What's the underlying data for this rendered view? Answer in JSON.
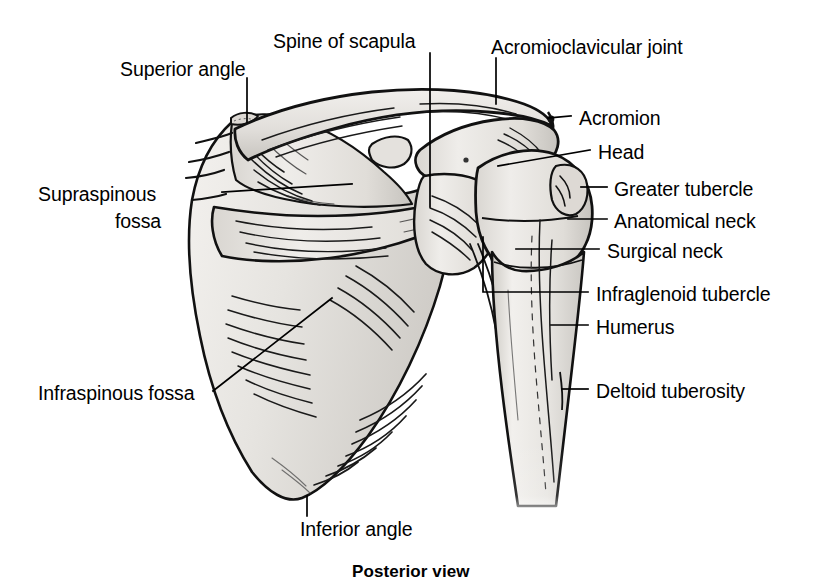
{
  "figure": {
    "caption": "Posterior view",
    "background_color": "#ffffff",
    "ink_color": "#000000",
    "bone_fill_color": "#e8e6e2",
    "bone_shadow_color": "#c9c6c1"
  },
  "labels": [
    {
      "id": "superior-angle",
      "text": "Superior angle",
      "x": 120,
      "y": 58,
      "align": "left"
    },
    {
      "id": "spine-of-scapula",
      "text": "Spine of scapula",
      "x": 273,
      "y": 30,
      "align": "left"
    },
    {
      "id": "acromioclavicular-joint",
      "text": "Acromioclavicular joint",
      "x": 491,
      "y": 36,
      "align": "left"
    },
    {
      "id": "acromion",
      "text": "Acromion",
      "x": 579,
      "y": 107,
      "align": "left"
    },
    {
      "id": "head",
      "text": "Head",
      "x": 598,
      "y": 141,
      "align": "left"
    },
    {
      "id": "greater-tubercle",
      "text": "Greater tubercle",
      "x": 614,
      "y": 178,
      "align": "left"
    },
    {
      "id": "anatomical-neck",
      "text": "Anatomical neck",
      "x": 614,
      "y": 210,
      "align": "left"
    },
    {
      "id": "surgical-neck",
      "text": "Surgical neck",
      "x": 607,
      "y": 240,
      "align": "left"
    },
    {
      "id": "infraglenoid-tubercle",
      "text": "Infraglenoid tubercle",
      "x": 596,
      "y": 283,
      "align": "left"
    },
    {
      "id": "humerus",
      "text": "Humerus",
      "x": 596,
      "y": 316,
      "align": "left"
    },
    {
      "id": "deltoid-tuberosity",
      "text": "Deltoid tuberosity",
      "x": 596,
      "y": 380,
      "align": "left"
    },
    {
      "id": "supraspinous-fossa-l1",
      "text": "Supraspinous",
      "x": 38,
      "y": 183,
      "align": "left"
    },
    {
      "id": "supraspinous-fossa-l2",
      "text": "fossa",
      "x": 115,
      "y": 210,
      "align": "left"
    },
    {
      "id": "infraspinous-fossa",
      "text": "Infraspinous fossa",
      "x": 38,
      "y": 382,
      "align": "left"
    },
    {
      "id": "inferior-angle",
      "text": "Inferior angle",
      "x": 300,
      "y": 518,
      "align": "left"
    }
  ],
  "caption_position": {
    "x": 352,
    "y": 562
  },
  "leader_lines": [
    {
      "id": "superior-angle-leader",
      "points": "247,78 247,122"
    },
    {
      "id": "spine-of-scapula-leader",
      "points": "430,53 430,207"
    },
    {
      "id": "acromioclavicular-joint-leader",
      "points": "496,58 496,102"
    },
    {
      "id": "acromion-leader",
      "points": "571,116 550,118"
    },
    {
      "id": "head-leader",
      "points": "590,150 498,166"
    },
    {
      "id": "greater-tubercle-leader",
      "points": "607,187 581,187"
    },
    {
      "id": "anatomical-neck-leader",
      "points": "607,219 574,219"
    },
    {
      "id": "surgical-neck-leader",
      "points": "599,249 516,249"
    },
    {
      "id": "infraglenoid-tubercle-leader",
      "points": "588,292 483,292 483,237"
    },
    {
      "id": "humerus-leader",
      "points": "588,325 551,325"
    },
    {
      "id": "deltoid-tuberosity-leader",
      "points": "588,389 566,389"
    },
    {
      "id": "supraspinous-fossa-leader",
      "points": "222,192 310,186"
    },
    {
      "id": "infraspinous-fossa-leader",
      "points": "213,391 330,300"
    },
    {
      "id": "inferior-angle-leader",
      "points": "307,496 307,516"
    }
  ],
  "anatomy_parts": [
    {
      "id": "clavicle",
      "name": "clavicle"
    },
    {
      "id": "acromion",
      "name": "acromion"
    },
    {
      "id": "scapula-body",
      "name": "scapula-body"
    },
    {
      "id": "spine-of-scapula",
      "name": "spine-of-scapula"
    },
    {
      "id": "supraspinous-fossa",
      "name": "supraspinous-fossa"
    },
    {
      "id": "infraspinous-fossa",
      "name": "infraspinous-fossa"
    },
    {
      "id": "humerus-head",
      "name": "humerus-head"
    },
    {
      "id": "humerus-shaft",
      "name": "humerus-shaft"
    },
    {
      "id": "greater-tubercle",
      "name": "greater-tubercle"
    }
  ]
}
